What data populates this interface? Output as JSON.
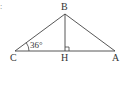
{
  "diagram": {
    "type": "triangle-with-altitude",
    "corner_mark": ":",
    "vertices": {
      "B": {
        "label": "B",
        "x": 65,
        "y": 14
      },
      "C": {
        "label": "C",
        "x": 15,
        "y": 51
      },
      "A": {
        "label": "A",
        "x": 115,
        "y": 51
      },
      "H": {
        "label": "H",
        "x": 65,
        "y": 51
      }
    },
    "segments": [
      "BC",
      "BA",
      "CA",
      "BH"
    ],
    "right_angle_at": "H",
    "angle": {
      "vertex": "C",
      "label": "36°"
    },
    "colors": {
      "stroke": "#444444",
      "text": "#333333",
      "background": "#ffffff"
    }
  }
}
